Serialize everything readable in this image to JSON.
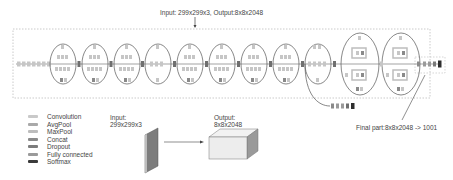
{
  "diagram": {
    "top_caption": "Input: 299x299x3, Output:8x8x2048",
    "final_caption": "Final part:8x8x2048 -> 1001",
    "input_label": "Input:",
    "input_size": "299x299x3",
    "output_label": "Output:",
    "output_size": "8x8x2048"
  },
  "legend": {
    "items": [
      {
        "label": "Convolution",
        "color": "#c9c9c9"
      },
      {
        "label": "AvgPool",
        "color": "#a9a9a9"
      },
      {
        "label": "MaxPool",
        "color": "#bdbdbd"
      },
      {
        "label": "Concat",
        "color": "#8a8a8a"
      },
      {
        "label": "Dropout",
        "color": "#7c7c7c"
      },
      {
        "label": "Fully connected",
        "color": "#9a9a9a"
      },
      {
        "label": "Softmax",
        "color": "#3a3a3a"
      }
    ]
  },
  "colors": {
    "conv": "#c6c6c6",
    "concat": "#6f6f6f",
    "softmax": "#2e2e2e",
    "line": "#555555",
    "dashed": "#b5b5b5"
  }
}
